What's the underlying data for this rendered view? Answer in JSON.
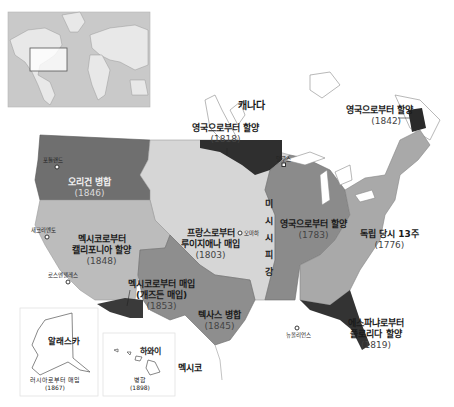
{
  "colors": {
    "background": "#ffffff",
    "world_inset_bg": "#c9c9c9",
    "world_land": "#e8e8e8",
    "canada": "#ffffff",
    "thirteen_colonies": "#a9a9a9",
    "british_1783": "#8b8b8b",
    "louisiana": "#d6d6d6",
    "oregon": "#6f6f6f",
    "mexican_cession": "#bcbcbc",
    "texas": "#8e8e8e",
    "gadsden": "#3a3a3a",
    "british_1818": "#2f2f2f",
    "british_1842": "#2a2a2a",
    "florida": "#333333",
    "water": "#ffffff"
  },
  "labels": {
    "canada": "캐나다",
    "mexico": "멕시코",
    "british_1818": {
      "title": "영국으로부터 할양",
      "year": "(1818)"
    },
    "british_1842": {
      "title": "영국으로부터 할양",
      "year": "(1842)"
    },
    "oregon": {
      "title": "오리건 병합",
      "year": "(1846)"
    },
    "california": {
      "title_line1": "멕시코로부터",
      "title_line2": "캘리포니아 할양",
      "year": "(1848)"
    },
    "louisiana": {
      "title_line1": "프랑스로부터",
      "title_line2": "루이지애나 매입",
      "year": "(1803)"
    },
    "british_1783": {
      "title": "영국으로부터 할양",
      "year": "(1783)"
    },
    "thirteen_colonies": {
      "title": "독립 당시 13주",
      "year": "(1776)"
    },
    "gadsden": {
      "title_line1": "멕시코로부터 매입",
      "title_line2": "(개즈든 매입)",
      "year": "(1853)"
    },
    "texas": {
      "title": "텍사스 병합",
      "year": "(1845)"
    },
    "florida": {
      "title_line1": "에스파냐로부터",
      "title_line2": "플로리다 할양",
      "year": "(1819)"
    },
    "mississippi": [
      "미",
      "시",
      "시",
      "피",
      "강"
    ],
    "alaska": {
      "name": "알래스카",
      "note": "러시아로부터 매입",
      "year": "(1867)"
    },
    "hawaii": {
      "name": "하와이",
      "note": "병합",
      "year": "(1898)"
    }
  },
  "cities": [
    {
      "name": "포틀랜드"
    },
    {
      "name": "새크라멘토"
    },
    {
      "name": "로스앤젤레스"
    },
    {
      "name": "오마하"
    },
    {
      "name": "덜루스"
    },
    {
      "name": "뉴올리언스"
    }
  ]
}
